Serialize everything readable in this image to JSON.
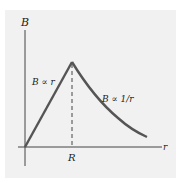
{
  "diagram": {
    "y_axis_label": "B",
    "x_axis_label": "r",
    "x_tick_label": "R",
    "inner_label": "B ∝ r",
    "outer_label": "B ∝ 1/r",
    "curve_color": "#555555",
    "axis_color": "#444444",
    "panel_color": "#f1f1f1"
  }
}
